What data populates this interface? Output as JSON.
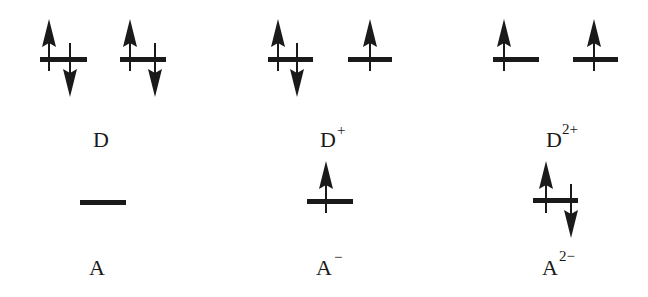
{
  "diagram": {
    "type": "electron-configuration",
    "donor_states": [
      {
        "label": "D",
        "charge": "",
        "orbitals": [
          {
            "electrons": [
              "up",
              "down"
            ]
          },
          {
            "electrons": [
              "up",
              "down"
            ]
          }
        ]
      },
      {
        "label": "D",
        "charge": "+",
        "orbitals": [
          {
            "electrons": [
              "up",
              "down"
            ]
          },
          {
            "electrons": [
              "up"
            ]
          }
        ]
      },
      {
        "label": "D",
        "charge": "2+",
        "orbitals": [
          {
            "electrons": [
              "up"
            ]
          },
          {
            "electrons": [
              "up"
            ]
          }
        ]
      }
    ],
    "acceptor_states": [
      {
        "label": "A",
        "charge": "",
        "orbitals": [
          {
            "electrons": []
          }
        ]
      },
      {
        "label": "A",
        "charge": "−",
        "orbitals": [
          {
            "electrons": [
              "up"
            ]
          }
        ]
      },
      {
        "label": "A",
        "charge": "2−",
        "orbitals": [
          {
            "electrons": [
              "up",
              "down"
            ]
          }
        ]
      }
    ],
    "colors": {
      "ink": "#1a1a1a",
      "background": "#ffffff"
    }
  }
}
